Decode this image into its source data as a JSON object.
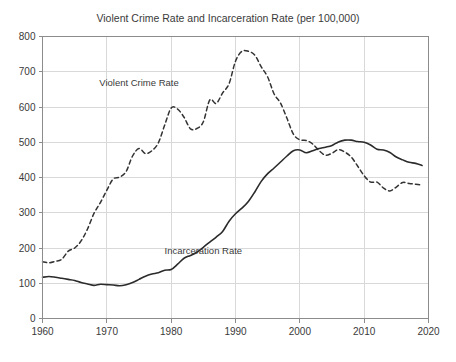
{
  "chart_data": {
    "type": "line",
    "title": "Violent Crime Rate and Incarceration Rate (per 100,000)",
    "xlabel": "",
    "ylabel": "",
    "xlim": [
      1960,
      2020
    ],
    "ylim": [
      0,
      800
    ],
    "xticks": [
      1960,
      1970,
      1980,
      1990,
      2000,
      2010,
      2020
    ],
    "yticks": [
      0,
      100,
      200,
      300,
      400,
      500,
      600,
      700,
      800
    ],
    "grid": true,
    "legend_position": "in-plot-annotations",
    "series": [
      {
        "name": "Violent Crime Rate",
        "style": "dashed",
        "color": "#333333",
        "label_x": 1975,
        "label_y": 660,
        "x": [
          1960,
          1961,
          1962,
          1963,
          1964,
          1965,
          1966,
          1967,
          1968,
          1969,
          1970,
          1971,
          1972,
          1973,
          1974,
          1975,
          1976,
          1977,
          1978,
          1979,
          1980,
          1981,
          1982,
          1983,
          1984,
          1985,
          1986,
          1987,
          1988,
          1989,
          1990,
          1991,
          1992,
          1993,
          1994,
          1995,
          1996,
          1997,
          1998,
          1999,
          2000,
          2001,
          2002,
          2003,
          2004,
          2005,
          2006,
          2007,
          2008,
          2009,
          2010,
          2011,
          2012,
          2013,
          2014,
          2015,
          2016,
          2017,
          2018,
          2019
        ],
        "values": [
          161,
          158,
          162,
          168,
          191,
          200,
          220,
          254,
          298,
          329,
          364,
          396,
          401,
          417,
          461,
          482,
          468,
          476,
          498,
          549,
          597,
          594,
          571,
          538,
          539,
          558,
          620,
          610,
          640,
          666,
          730,
          758,
          758,
          747,
          714,
          685,
          637,
          611,
          568,
          523,
          507,
          505,
          495,
          476,
          463,
          469,
          479,
          472,
          458,
          432,
          405,
          387,
          387,
          370,
          362,
          373,
          386,
          383,
          381,
          379
        ]
      },
      {
        "name": "Incarceration Rate",
        "style": "solid",
        "color": "#2b2b2b",
        "label_x": 1985,
        "label_y": 182,
        "x": [
          1960,
          1961,
          1962,
          1963,
          1964,
          1965,
          1966,
          1967,
          1968,
          1969,
          1970,
          1971,
          1972,
          1973,
          1974,
          1975,
          1976,
          1977,
          1978,
          1979,
          1980,
          1981,
          1982,
          1983,
          1984,
          1985,
          1986,
          1987,
          1988,
          1989,
          1990,
          1991,
          1992,
          1993,
          1994,
          1995,
          1996,
          1997,
          1998,
          1999,
          2000,
          2001,
          2002,
          2003,
          2004,
          2005,
          2006,
          2007,
          2008,
          2009,
          2010,
          2011,
          2012,
          2013,
          2014,
          2015,
          2016,
          2017,
          2018,
          2019
        ],
        "values": [
          117,
          119,
          117,
          114,
          111,
          108,
          102,
          98,
          94,
          97,
          96,
          95,
          93,
          96,
          102,
          111,
          120,
          126,
          130,
          137,
          139,
          154,
          171,
          179,
          188,
          202,
          217,
          231,
          247,
          276,
          297,
          313,
          332,
          359,
          389,
          411,
          427,
          444,
          461,
          476,
          478,
          470,
          476,
          482,
          486,
          491,
          501,
          506,
          506,
          502,
          500,
          492,
          480,
          478,
          471,
          458,
          450,
          443,
          440,
          434
        ]
      }
    ]
  }
}
